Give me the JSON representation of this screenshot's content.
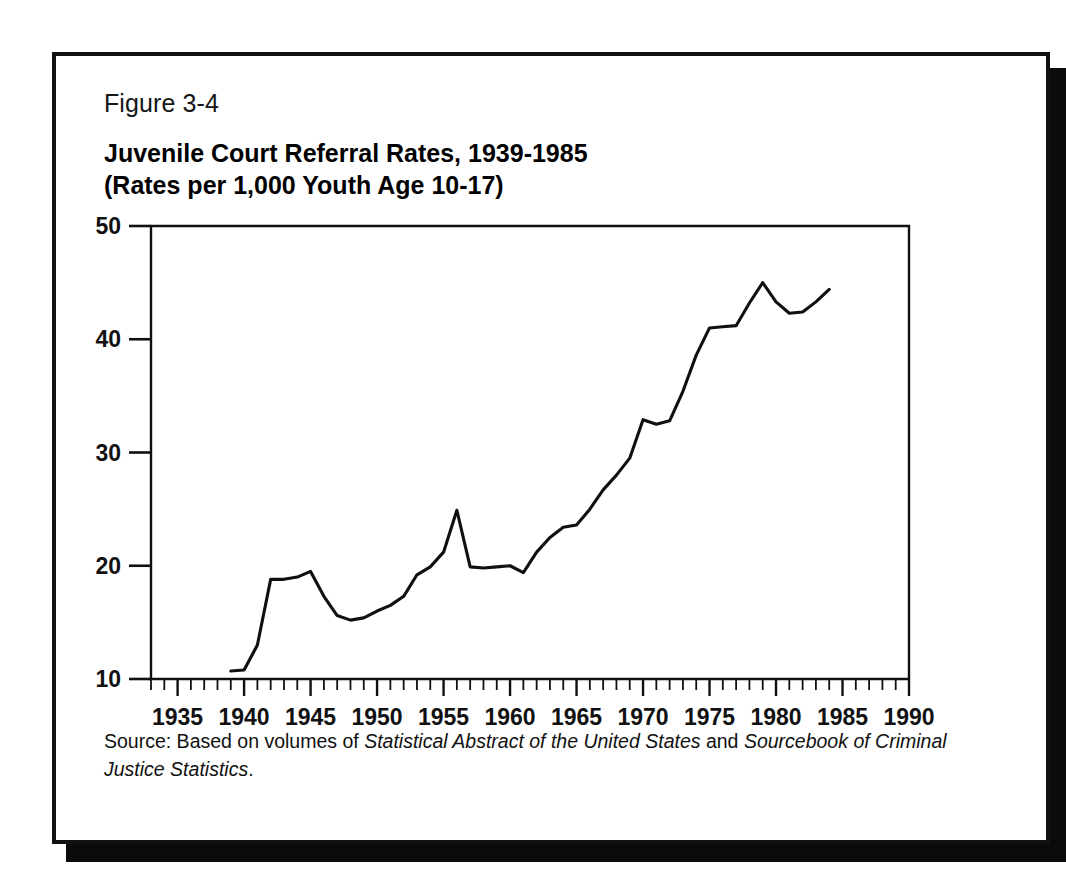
{
  "figure": {
    "number": "Figure 3-4",
    "title_line1": "Juvenile Court Referral Rates, 1939-1985",
    "title_line2": "(Rates per 1,000 Youth Age 10-17)",
    "source_prefix": "Source: Based on volumes of ",
    "source_italic1": "Statistical Abstract of the United States",
    "source_mid": " and ",
    "source_italic2": "Sourcebook of Criminal Justice Statistics",
    "source_suffix": ".",
    "frame_color": "#111111",
    "shadow_color": "#0b0b0b",
    "line_color": "#101010",
    "background": "#ffffff"
  },
  "chart_data": {
    "type": "line",
    "title": "Juvenile Court Referral Rates, 1939-1985",
    "subtitle": "(Rates per 1,000 Youth Age 10-17)",
    "xlabel": "",
    "ylabel": "",
    "xlim": [
      1933,
      1990
    ],
    "ylim": [
      10,
      50
    ],
    "xticks": [
      1935,
      1940,
      1945,
      1950,
      1955,
      1960,
      1965,
      1970,
      1975,
      1980,
      1985,
      1990
    ],
    "xtick_labels": [
      "1935",
      "1940",
      "1945",
      "1950",
      "1955",
      "1960",
      "1965",
      "1970",
      "1975",
      "1980",
      "1985",
      "1990"
    ],
    "yticks": [
      10,
      20,
      30,
      40,
      50
    ],
    "ytick_labels": [
      "10",
      "20",
      "30",
      "40",
      "50"
    ],
    "minor_xtick_interval": 1,
    "grid": false,
    "legend": null,
    "series": [
      {
        "name": "Juvenile court referral rate per 1,000 youth age 10-17",
        "x": [
          1939,
          1940,
          1941,
          1942,
          1943,
          1944,
          1945,
          1946,
          1947,
          1948,
          1949,
          1950,
          1951,
          1952,
          1953,
          1954,
          1955,
          1956,
          1957,
          1958,
          1959,
          1960,
          1961,
          1962,
          1963,
          1964,
          1965,
          1966,
          1967,
          1968,
          1969,
          1970,
          1971,
          1972,
          1973,
          1974,
          1975,
          1976,
          1977,
          1978,
          1979,
          1980,
          1981,
          1982,
          1983,
          1984
        ],
        "y": [
          10.7,
          10.8,
          13.0,
          18.8,
          18.8,
          19.0,
          19.5,
          17.3,
          15.6,
          15.2,
          15.4,
          16.0,
          16.5,
          17.3,
          19.2,
          19.9,
          21.2,
          24.9,
          19.9,
          19.8,
          19.9,
          20.0,
          19.4,
          21.2,
          22.5,
          23.4,
          23.6,
          25.0,
          26.7,
          28.0,
          29.5,
          32.9,
          32.5,
          32.8,
          35.4,
          38.6,
          41.0,
          41.1,
          41.2,
          43.2,
          45.0,
          43.3,
          42.3,
          42.4,
          43.3,
          44.4
        ]
      }
    ]
  }
}
